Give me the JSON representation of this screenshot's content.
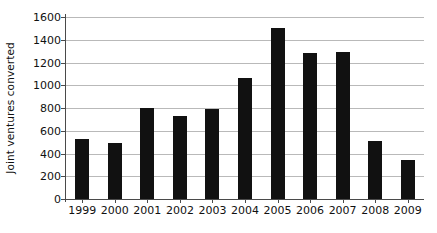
{
  "chart_data": {
    "type": "bar",
    "title": "",
    "xlabel": "",
    "ylabel": "Joint ventures converted",
    "categories": [
      "1999",
      "2000",
      "2001",
      "2002",
      "2003",
      "2004",
      "2005",
      "2006",
      "2007",
      "2008",
      "2009"
    ],
    "values": [
      530,
      490,
      800,
      730,
      790,
      1060,
      1500,
      1280,
      1290,
      510,
      340
    ],
    "ylim": [
      0,
      1600
    ],
    "ytick_step": 200,
    "yticks": [
      "0",
      "200",
      "400",
      "600",
      "800",
      "1000",
      "1200",
      "1400",
      "1600"
    ],
    "grid": true,
    "legend": "none",
    "bar_color": "#111111",
    "gridline_color": "#b9b9b9",
    "axis_color": "#4a4a4a",
    "background_color": "#ffffff"
  }
}
